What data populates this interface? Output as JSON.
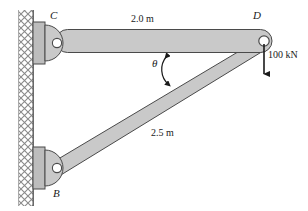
{
  "figure": {
    "type": "statics-free-body-diagram",
    "background_color": "#ffffff",
    "member_fill": "#c9c9c9",
    "member_stroke": "#4a4a4a",
    "wall_hatch_color": "#8a8a8a",
    "plate_fill": "#bdbdbd",
    "line_color": "#1a1a1a"
  },
  "nodes": [
    {
      "id": "C",
      "label": "C",
      "role": "upper-pin-support"
    },
    {
      "id": "D",
      "label": "D",
      "role": "loaded-joint"
    },
    {
      "id": "B",
      "label": "B",
      "role": "lower-pin-support"
    }
  ],
  "members": [
    {
      "id": "CD",
      "from": "C",
      "to": "D",
      "length_label": "2.0 m",
      "orientation": "horizontal"
    },
    {
      "id": "BD",
      "from": "B",
      "to": "D",
      "length_label": "2.5 m",
      "orientation": "inclined"
    }
  ],
  "dimensions": {
    "top_member": "2.0 m",
    "diagonal_member": "2.5 m"
  },
  "angle": {
    "symbol": "θ",
    "between": [
      "CD",
      "BD"
    ],
    "vertex": "D"
  },
  "load": {
    "magnitude": "100 kN",
    "direction": "down",
    "applied_at": "D"
  },
  "wall": {
    "name": "fixed-wall",
    "hatch_style": "cross-hatch"
  }
}
